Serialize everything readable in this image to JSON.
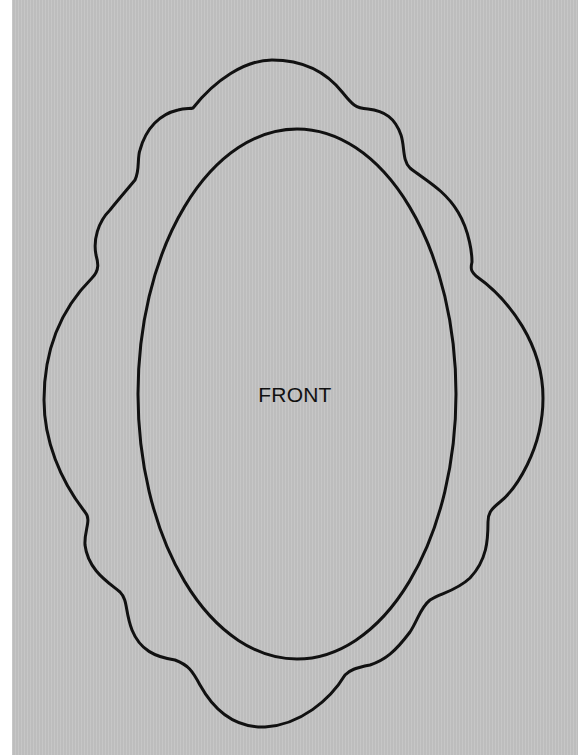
{
  "diagram": {
    "type": "template-outline",
    "label": "FRONT",
    "shapes": [
      {
        "name": "outer-scalloped-frame",
        "stroke": "#111111"
      },
      {
        "name": "inner-oval",
        "stroke": "#111111"
      }
    ]
  },
  "colors": {
    "background": "#c3c3c3",
    "edge_strip": "#ffffff",
    "line": "#111111",
    "text": "#111111"
  }
}
